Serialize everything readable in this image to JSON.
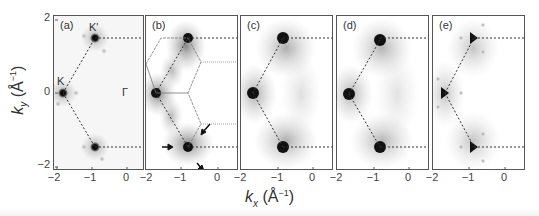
{
  "figure": {
    "y_axis": {
      "title_main": "k",
      "title_sub": "y",
      "title_unit": " (Å",
      "title_exp": "−1",
      "title_close": ")",
      "ticks": [
        "2",
        "0",
        "−2"
      ]
    },
    "x_axis": {
      "title_main": "k",
      "title_sub": "x",
      "title_unit": " (Å",
      "title_exp": "−1",
      "title_close": ")",
      "ticks": [
        "−2",
        "−1",
        "0"
      ]
    },
    "panels": [
      {
        "label": "(a)",
        "annotations": {
          "k": "K",
          "kprime": "K'",
          "gamma": "Γ"
        }
      },
      {
        "label": "(b)"
      },
      {
        "label": "(c)"
      },
      {
        "label": "(d)"
      },
      {
        "label": "(e)"
      }
    ]
  }
}
